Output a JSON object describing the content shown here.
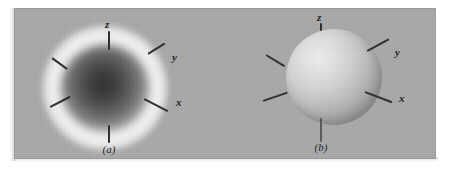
{
  "figure": {
    "kind": "scientific-illustration",
    "background_color": "#a9a9a9",
    "page_color": "#ffffff"
  },
  "panels": [
    {
      "id": "a",
      "caption": "(a)",
      "representation": "probability-density-cloud",
      "cloud": {
        "core_color": "#303030",
        "halo_color": "#fcfcfc",
        "mid_color": "#7a7a7a"
      },
      "axes": [
        {
          "name": "z",
          "label": "z",
          "direction": "up",
          "labeled": true
        },
        {
          "name": "z-negative",
          "label": "",
          "direction": "down",
          "labeled": false
        },
        {
          "name": "y",
          "label": "y",
          "direction": "upper-right",
          "labeled": true
        },
        {
          "name": "x",
          "label": "x",
          "direction": "lower-right",
          "labeled": true
        },
        {
          "name": "y-negative",
          "label": "",
          "direction": "upper-left",
          "labeled": false
        },
        {
          "name": "x-negative",
          "label": "",
          "direction": "lower-left",
          "labeled": false
        }
      ]
    },
    {
      "id": "b",
      "caption": "(b)",
      "representation": "boundary-surface-sphere",
      "sphere": {
        "highlight_color": "#ededed",
        "shadow_color": "#848484",
        "mid_color": "#bfbfbf"
      },
      "axes": [
        {
          "name": "z",
          "label": "z",
          "direction": "up",
          "labeled": true
        },
        {
          "name": "z-negative",
          "label": "",
          "direction": "down",
          "labeled": false
        },
        {
          "name": "y",
          "label": "y",
          "direction": "upper-right",
          "labeled": true
        },
        {
          "name": "x",
          "label": "x",
          "direction": "lower-right",
          "labeled": true
        },
        {
          "name": "y-negative",
          "label": "",
          "direction": "upper-left",
          "labeled": false
        },
        {
          "name": "x-negative",
          "label": "",
          "direction": "lower-left",
          "labeled": false
        }
      ]
    }
  ],
  "colors": {
    "axis_line": "#2e2e2e",
    "label_text": "#1f1f1f",
    "plate": "#a9a9a9"
  }
}
